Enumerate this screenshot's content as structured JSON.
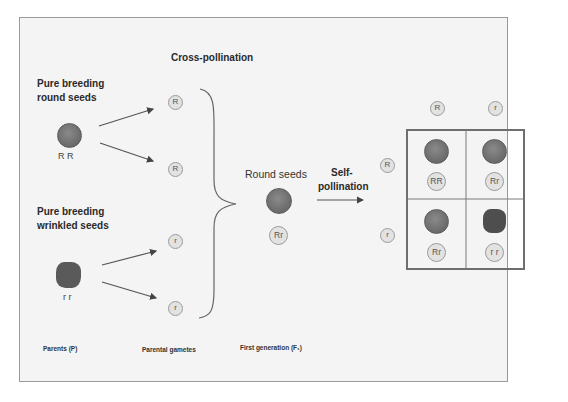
{
  "diagram": {
    "cross_pollination_label": "Cross-pollination",
    "self_pollination_label_line1": "Self-",
    "self_pollination_label_line2": "pollination",
    "parents": {
      "round": {
        "label_line1": "Pure breeding",
        "label_line2": "round seeds",
        "genotype": "R R"
      },
      "wrinkled": {
        "label_line1": "Pure breeding",
        "label_line2": "wrinkled seeds",
        "genotype": "r r"
      }
    },
    "gametes": [
      "R",
      "R",
      "r",
      "r"
    ],
    "f1": {
      "label": "Round seeds",
      "genotype": "Rr"
    },
    "punnett": {
      "column_gametes": [
        "R",
        "r"
      ],
      "row_gametes": [
        "R",
        "r"
      ],
      "cells": [
        {
          "genotype": "RR",
          "phenotype": "round"
        },
        {
          "genotype": "Rr",
          "phenotype": "round"
        },
        {
          "genotype": "Rr",
          "phenotype": "round"
        },
        {
          "genotype": "r r",
          "phenotype": "wrinkled"
        }
      ]
    },
    "stage_labels": {
      "parents": "Parents (P)",
      "gametes": "Parental gametes",
      "f1": "First generation (F₁)"
    },
    "colors": {
      "seed": "#6e6e6e",
      "gamete_fill": "#e2e2e2",
      "gamete_border": "#9b9b9b",
      "frame_bg": "#f4f4f4",
      "line": "#555555"
    }
  }
}
